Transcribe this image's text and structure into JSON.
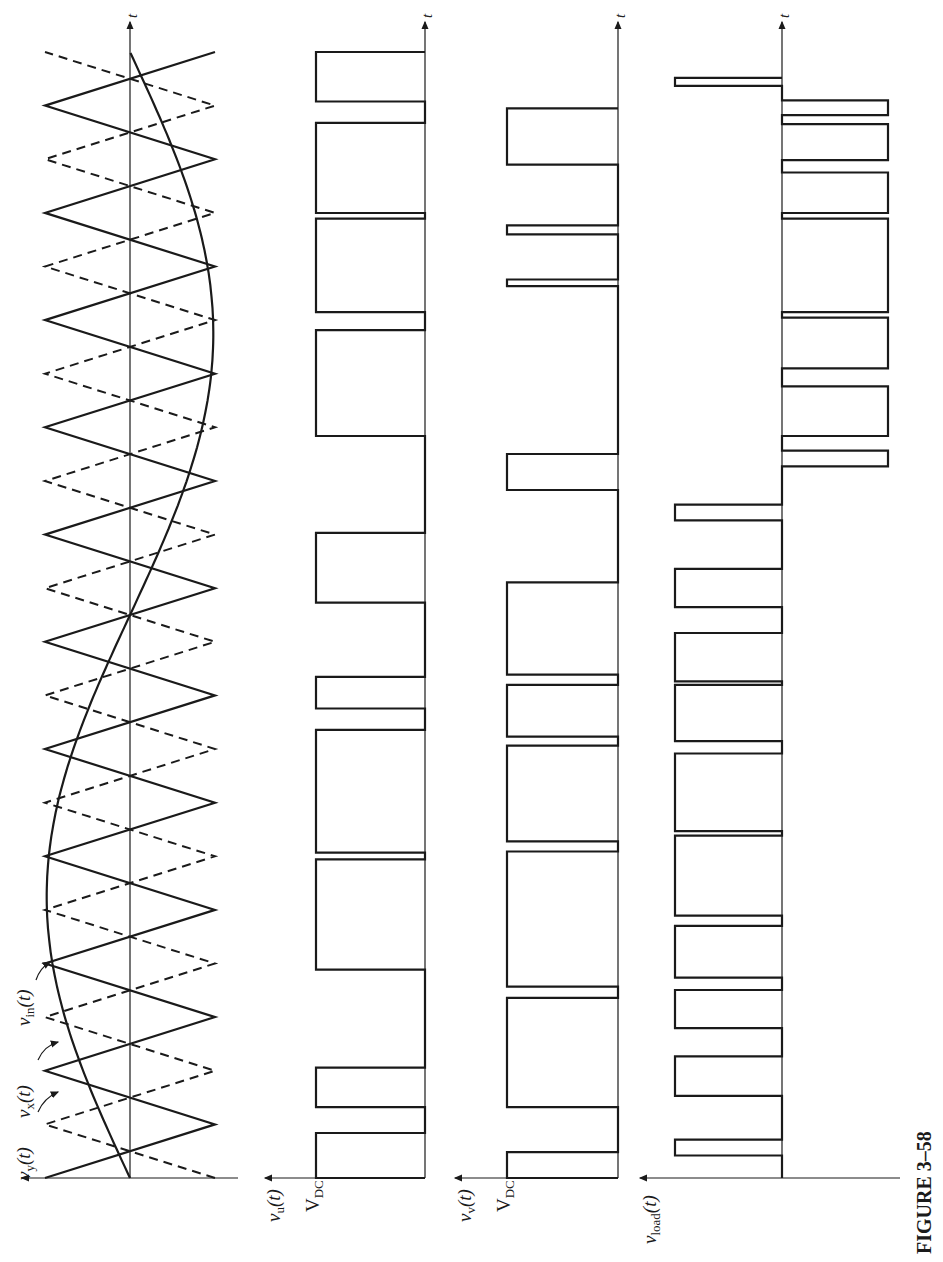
{
  "figure": {
    "caption": "FIGURE 3–58",
    "time_label": "t"
  },
  "labels": {
    "vy": {
      "main": "v",
      "sub": "y",
      "arg": "(t)"
    },
    "vx": {
      "main": "v",
      "sub": "x",
      "arg": "(t)"
    },
    "vin": {
      "main": "v",
      "sub": "in",
      "arg": "(t)"
    },
    "vu": {
      "main": "v",
      "sub": "u",
      "arg": "(t)"
    },
    "vv": {
      "main": "v",
      "sub": "v",
      "arg": "(t)"
    },
    "vload": {
      "main": "v",
      "sub": "load",
      "arg": "(t)"
    },
    "vdc_u": {
      "main": "V",
      "sub": "DC"
    },
    "vdc_v": {
      "main": "V",
      "sub": "DC"
    }
  },
  "chart_data": [
    {
      "type": "line",
      "title": "Carrier and reference waveforms",
      "xlabel": "t",
      "ylabel": "",
      "series": [
        {
          "name": "v_x(t)",
          "style": "solid triangle carrier",
          "periods": 10.5,
          "amplitude": 1.0
        },
        {
          "name": "v_y(t)",
          "style": "dashed triangle carrier (inverted v_x)",
          "periods": 10.5,
          "amplitude": 1.0
        },
        {
          "name": "v_in(t)",
          "style": "solid sinusoid",
          "cycles": 1.0,
          "amplitude": 1.0
        }
      ],
      "ylim": [
        -1,
        1
      ],
      "grid": false
    },
    {
      "type": "line",
      "title": "v_u(t)",
      "xlabel": "t",
      "ylabel": "v_u(t)",
      "levels": [
        "0",
        "V_DC"
      ],
      "pulses_high": [
        [
          0.0,
          0.04
        ],
        [
          0.063,
          0.098
        ],
        [
          0.185,
          0.283
        ],
        [
          0.289,
          0.398
        ],
        [
          0.417,
          0.445
        ],
        [
          0.511,
          0.573
        ],
        [
          0.659,
          0.753
        ],
        [
          0.769,
          0.852
        ],
        [
          0.857,
          0.937
        ],
        [
          0.956,
          1.0
        ]
      ],
      "ylim": [
        0,
        1
      ]
    },
    {
      "type": "line",
      "title": "v_v(t)",
      "xlabel": "t",
      "ylabel": "v_v(t)",
      "levels": [
        "0",
        "V_DC"
      ],
      "pulses_high": [
        [
          0.0,
          0.023
        ],
        [
          0.063,
          0.16
        ],
        [
          0.17,
          0.29
        ],
        [
          0.299,
          0.384
        ],
        [
          0.392,
          0.438
        ],
        [
          0.447,
          0.529
        ],
        [
          0.611,
          0.643
        ],
        [
          0.792,
          0.798
        ],
        [
          0.838,
          0.846
        ],
        [
          0.9,
          0.95
        ]
      ],
      "ylim": [
        0,
        1
      ]
    },
    {
      "type": "line",
      "title": "v_load(t)",
      "xlabel": "t",
      "ylabel": "v_load(t)",
      "levels": [
        "-V_DC",
        "0",
        "V_DC"
      ],
      "pulses": [
        {
          "t": [
            0.02,
            0.034
          ],
          "level": 1
        },
        {
          "t": [
            0.073,
            0.108
          ],
          "level": 1
        },
        {
          "t": [
            0.133,
            0.167
          ],
          "level": 1
        },
        {
          "t": [
            0.178,
            0.224
          ],
          "level": 1
        },
        {
          "t": [
            0.233,
            0.304
          ],
          "level": 1
        },
        {
          "t": [
            0.308,
            0.377
          ],
          "level": 1
        },
        {
          "t": [
            0.388,
            0.438
          ],
          "level": 1
        },
        {
          "t": [
            0.441,
            0.484
          ],
          "level": 1
        },
        {
          "t": [
            0.507,
            0.541
          ],
          "level": 1
        },
        {
          "t": [
            0.584,
            0.598
          ],
          "level": 1
        },
        {
          "t": [
            0.632,
            0.646
          ],
          "level": -1
        },
        {
          "t": [
            0.659,
            0.703
          ],
          "level": -1
        },
        {
          "t": [
            0.719,
            0.764
          ],
          "level": -1
        },
        {
          "t": [
            0.769,
            0.852
          ],
          "level": -1
        },
        {
          "t": [
            0.857,
            0.893
          ],
          "level": -1
        },
        {
          "t": [
            0.904,
            0.936
          ],
          "level": -1
        },
        {
          "t": [
            0.944,
            0.957
          ],
          "level": -1
        },
        {
          "t": [
            0.97,
            0.977
          ],
          "level": 1
        }
      ],
      "ylim": [
        -1,
        1
      ]
    }
  ],
  "geometry": {
    "t0_y": 1178,
    "t1_y": 52,
    "arrow_y": 22,
    "panels": [
      {
        "axis_x": 130,
        "pos_x": 45,
        "neg_x": 215,
        "baseline_start": 22,
        "vaxis_from": 215,
        "vaxis_to": 22
      },
      {
        "axis_x": 425,
        "high_x": 316,
        "vaxis_from": 425,
        "vaxis_to": 265
      },
      {
        "axis_x": 618,
        "high_x": 507,
        "vaxis_from": 618,
        "vaxis_to": 455
      },
      {
        "axis_x": 782,
        "pos_x": 675,
        "neg_x": 888,
        "vaxis_from": 900,
        "vaxis_to": 640
      }
    ]
  }
}
